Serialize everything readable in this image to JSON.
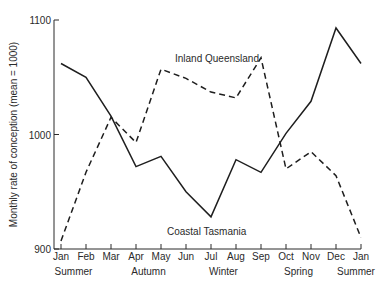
{
  "chart_data": {
    "type": "line",
    "title": "",
    "xlabel": "",
    "ylabel": "Monthly rate of conception  (mean = 1000)",
    "ylim": [
      900,
      1100
    ],
    "yticks": [
      900,
      1000,
      1100
    ],
    "grid": false,
    "legend": "inline annotations",
    "categories": [
      "Jan",
      "Feb",
      "Mar",
      "Apr",
      "May",
      "Jun",
      "Jul",
      "Aug",
      "Sep",
      "Oct",
      "Nov",
      "Dec",
      "Jan"
    ],
    "seasons": [
      {
        "label": "Summer",
        "month_index": 0.5
      },
      {
        "label": "Autumn",
        "month_index": 3.5
      },
      {
        "label": "Winter",
        "month_index": 6.5
      },
      {
        "label": "Spring",
        "month_index": 9.5
      },
      {
        "label": "Summer",
        "month_index": 11.8
      }
    ],
    "series": [
      {
        "name": "Coastal Tasmania",
        "style": "solid",
        "values": [
          1062,
          1050,
          1016,
          972,
          981,
          950,
          928,
          978,
          967,
          1001,
          1029,
          1093,
          1062
        ]
      },
      {
        "name": "Inland Queensland",
        "style": "dashed",
        "values": [
          907,
          967,
          1015,
          993,
          1057,
          1049,
          1037,
          1032,
          1067,
          970,
          985,
          964,
          910
        ]
      }
    ],
    "annotations": [
      {
        "text": "Inland Queensland",
        "x": 175,
        "y": 62
      },
      {
        "text": "Coastal Tasmania",
        "x": 167,
        "y": 235
      }
    ]
  }
}
